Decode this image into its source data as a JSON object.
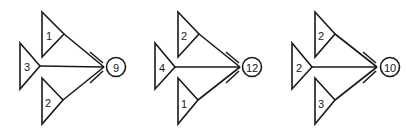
{
  "diagram": {
    "figures": [
      {
        "id": "figure-1",
        "top_triangle": {
          "label": "1"
        },
        "left_triangle": {
          "label": "3"
        },
        "bottom_triangle": {
          "label": "2"
        },
        "result_circle": {
          "label": "9"
        }
      },
      {
        "id": "figure-2",
        "top_triangle": {
          "label": "2"
        },
        "left_triangle": {
          "label": "4"
        },
        "bottom_triangle": {
          "label": "1"
        },
        "result_circle": {
          "label": "12"
        }
      },
      {
        "id": "figure-3",
        "top_triangle": {
          "label": "2"
        },
        "left_triangle": {
          "label": "2"
        },
        "bottom_triangle": {
          "label": "3"
        },
        "result_circle": {
          "label": "10"
        }
      }
    ],
    "colors": {
      "stroke": "#1a1a1a",
      "background": "#ffffff"
    }
  }
}
